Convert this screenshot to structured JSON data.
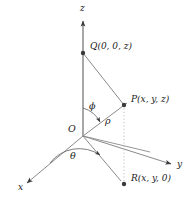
{
  "figure": {
    "colors": {
      "line": "#7a7a7a",
      "line_dark": "#4d4d4d",
      "dot": "#3a3a3a",
      "text": "#1a1a1a",
      "dotted": "#b0b0b0",
      "background": "#ffffff"
    },
    "axes": [
      {
        "id": "z",
        "label": "z",
        "x": 80,
        "y": 9,
        "direction": "up"
      },
      {
        "id": "y",
        "label": "y",
        "x": 177,
        "y": 166,
        "direction": "lower-right"
      },
      {
        "id": "x",
        "label": "x",
        "x": 18,
        "y": 188,
        "direction": "lower-left"
      }
    ],
    "origin": {
      "id": "O",
      "label": "O",
      "x": 68,
      "y": 128,
      "px": 83,
      "py": 136
    },
    "points": [
      {
        "id": "Q",
        "label": "Q(0, 0, z)",
        "x": 90,
        "y": 46,
        "px": 83,
        "py": 53
      },
      {
        "id": "P",
        "label": "P(x, y, z)",
        "x": 131,
        "y": 99,
        "px": 124,
        "py": 105
      },
      {
        "id": "R",
        "label": "R(x, y, 0)",
        "x": 131,
        "y": 178,
        "px": 124,
        "py": 184
      }
    ],
    "angles": [
      {
        "id": "phi",
        "label": "ϕ",
        "x": 89,
        "y": 106,
        "description": "angle from positive z-axis to ray OP"
      },
      {
        "id": "theta",
        "label": "θ",
        "x": 70,
        "y": 155,
        "description": "angle in xy-plane from x-axis to ray OR"
      }
    ],
    "segments": [
      {
        "id": "rho",
        "label": "ρ",
        "x": 105,
        "y": 120,
        "description": "radial distance from O to P"
      }
    ]
  }
}
